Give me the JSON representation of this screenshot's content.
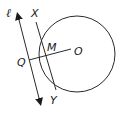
{
  "diagram": {
    "colors": {
      "stroke": "#2a2a2a",
      "background": "#ffffff",
      "text": "#1a1a1a"
    },
    "circle": {
      "cx": 77,
      "cy": 54,
      "r": 38
    },
    "labels": {
      "line": "ℓ",
      "x": "X",
      "m": "M",
      "o": "O",
      "q": "Q",
      "y": "Y"
    },
    "points": {
      "X": [
        36,
        22
      ],
      "Y": [
        56,
        90
      ],
      "Q": [
        29,
        60
      ],
      "O": [
        71,
        49
      ],
      "M": [
        45,
        56
      ]
    },
    "line_l": {
      "start": [
        16,
        12
      ],
      "end": [
        41,
        106
      ],
      "arrows": "both"
    }
  }
}
